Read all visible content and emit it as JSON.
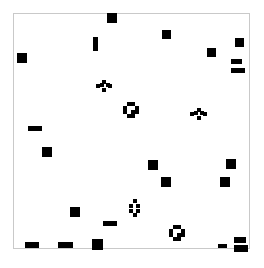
{
  "figure": {
    "background_color": "#ffffff",
    "frame_color": "#c9c9c9",
    "mark_color": "#000000",
    "caption_text": "",
    "caption_color": "#b8b8b8"
  },
  "chart_data": {
    "type": "scatter",
    "title": "",
    "subtitle": "",
    "xlabel": "",
    "ylabel": "",
    "xlim": [
      0,
      237
    ],
    "ylim": [
      0,
      236
    ],
    "grid": false,
    "legend": null,
    "axis_ticks": {
      "x": [],
      "y": []
    },
    "tick_labels": {
      "x": [],
      "y": []
    },
    "annotations": [],
    "marker_shapes": [
      "filled-square",
      "horizontal-dash",
      "vertical-bar",
      "open-diamond",
      "open-cluster"
    ],
    "point_count": 31,
    "points": [
      {
        "id": 1,
        "shape": "filled-square",
        "x": 94,
        "y": 0,
        "w": 10,
        "h": 10
      },
      {
        "id": 2,
        "shape": "filled-square",
        "x": 149,
        "y": 17,
        "w": 9,
        "h": 9
      },
      {
        "id": 3,
        "shape": "filled-square",
        "x": 222,
        "y": 25,
        "w": 9,
        "h": 9
      },
      {
        "id": 4,
        "shape": "vertical-bar",
        "x": 80,
        "y": 24,
        "w": 5,
        "h": 14
      },
      {
        "id": 5,
        "shape": "filled-square",
        "x": 194,
        "y": 35,
        "w": 9,
        "h": 9
      },
      {
        "id": 6,
        "shape": "filled-square",
        "x": 4,
        "y": 40,
        "w": 10,
        "h": 10
      },
      {
        "id": 7,
        "shape": "dash",
        "x": 218,
        "y": 46,
        "w": 11,
        "h": 5
      },
      {
        "id": 8,
        "shape": "dash",
        "x": 218,
        "y": 55,
        "w": 14,
        "h": 5
      },
      {
        "id": 9,
        "shape": "open-diamond",
        "x": 83,
        "y": 67,
        "w": 16,
        "h": 12
      },
      {
        "id": 10,
        "shape": "open-cluster",
        "x": 110,
        "y": 89,
        "w": 16,
        "h": 16
      },
      {
        "id": 11,
        "shape": "open-diamond",
        "x": 177,
        "y": 95,
        "w": 17,
        "h": 12
      },
      {
        "id": 12,
        "shape": "dash",
        "x": 15,
        "y": 113,
        "w": 14,
        "h": 5
      },
      {
        "id": 13,
        "shape": "filled-square",
        "x": 29,
        "y": 134,
        "w": 10,
        "h": 10
      },
      {
        "id": 14,
        "shape": "filled-square",
        "x": 135,
        "y": 147,
        "w": 10,
        "h": 10
      },
      {
        "id": 15,
        "shape": "filled-square",
        "x": 213,
        "y": 146,
        "w": 10,
        "h": 10
      },
      {
        "id": 16,
        "shape": "filled-square",
        "x": 148,
        "y": 164,
        "w": 10,
        "h": 10
      },
      {
        "id": 17,
        "shape": "filled-square",
        "x": 207,
        "y": 164,
        "w": 10,
        "h": 10
      },
      {
        "id": 18,
        "shape": "filled-square",
        "x": 57,
        "y": 194,
        "w": 10,
        "h": 10
      },
      {
        "id": 19,
        "shape": "open-diamond-v",
        "x": 116,
        "y": 186,
        "w": 11,
        "h": 18
      },
      {
        "id": 20,
        "shape": "dash",
        "x": 90,
        "y": 208,
        "w": 14,
        "h": 5
      },
      {
        "id": 21,
        "shape": "open-cluster",
        "x": 156,
        "y": 212,
        "w": 16,
        "h": 16
      },
      {
        "id": 22,
        "shape": "dash",
        "x": 12,
        "y": 229,
        "w": 14,
        "h": 6
      },
      {
        "id": 23,
        "shape": "dash",
        "x": 45,
        "y": 229,
        "w": 15,
        "h": 6
      },
      {
        "id": 24,
        "shape": "filled-square",
        "x": 79,
        "y": 226,
        "w": 11,
        "h": 11
      },
      {
        "id": 25,
        "shape": "dash",
        "x": 205,
        "y": 231,
        "w": 9,
        "h": 4
      },
      {
        "id": 26,
        "shape": "dash",
        "x": 221,
        "y": 224,
        "w": 12,
        "h": 6
      },
      {
        "id": 27,
        "shape": "dash",
        "x": 221,
        "y": 232,
        "w": 14,
        "h": 7
      }
    ]
  }
}
